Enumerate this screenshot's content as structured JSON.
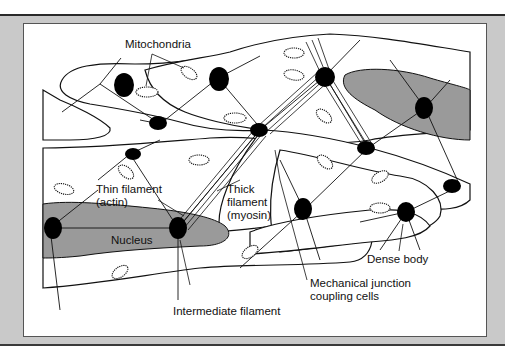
{
  "figure": {
    "type": "smooth muscle cell network diagram",
    "colors": {
      "frame": "#c9c9c9",
      "panel": "#ffffff",
      "nucleus": "#9a9a9a",
      "dense_body": "#000000",
      "line": "#111111"
    }
  },
  "labels": {
    "mitochondria": "Mitochondria",
    "thin_filament_line1": "Thin filament",
    "thin_filament_line2": "(actin)",
    "thick_filament_line1": "Thick",
    "thick_filament_line2": "filament",
    "thick_filament_line3": "(myosin)",
    "nucleus": "Nucleus",
    "dense_body": "Dense body",
    "mechanical_junction_line1": "Mechanical junction",
    "mechanical_junction_line2": "coupling cells",
    "intermediate_filament": "Intermediate filament"
  }
}
